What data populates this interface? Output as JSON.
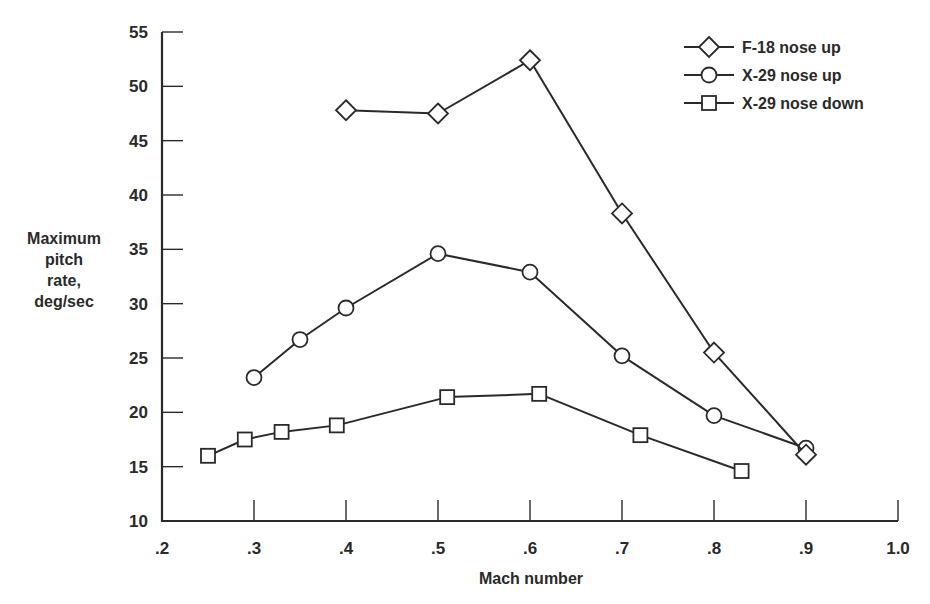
{
  "chart_data": {
    "type": "line",
    "title": "",
    "xlabel": "Mach number",
    "ylabel": [
      "Maximum",
      "pitch",
      "rate,",
      "deg/sec"
    ],
    "xlim": [
      0.2,
      1.0
    ],
    "ylim": [
      10,
      55
    ],
    "x_ticks": [
      0.2,
      0.3,
      0.4,
      0.5,
      0.6,
      0.7,
      0.8,
      0.9,
      1.0
    ],
    "x_tick_labels": [
      ".2",
      ".3",
      ".4",
      ".5",
      ".6",
      ".7",
      ".8",
      ".9",
      "1.0"
    ],
    "y_ticks": [
      10,
      15,
      20,
      25,
      30,
      35,
      40,
      45,
      50,
      55
    ],
    "y_tick_labels": [
      "10",
      "15",
      "20",
      "25",
      "30",
      "35",
      "40",
      "45",
      "50",
      "55"
    ],
    "grid": false,
    "legend_position": "top-right",
    "series": [
      {
        "name": "F-18 nose up",
        "marker": "diamond",
        "x": [
          0.4,
          0.5,
          0.6,
          0.7,
          0.8,
          0.9
        ],
        "y": [
          47.8,
          47.5,
          52.4,
          38.3,
          25.5,
          16.1
        ]
      },
      {
        "name": "X-29 nose up",
        "marker": "circle",
        "x": [
          0.3,
          0.35,
          0.4,
          0.5,
          0.6,
          0.7,
          0.8,
          0.9
        ],
        "y": [
          23.2,
          26.7,
          29.6,
          34.6,
          32.9,
          25.2,
          19.7,
          16.7
        ]
      },
      {
        "name": "X-29 nose down",
        "marker": "square",
        "x": [
          0.25,
          0.29,
          0.33,
          0.39,
          0.51,
          0.61,
          0.72,
          0.83
        ],
        "y": [
          16.0,
          17.5,
          18.2,
          18.8,
          21.4,
          21.7,
          17.9,
          14.6
        ]
      }
    ]
  }
}
